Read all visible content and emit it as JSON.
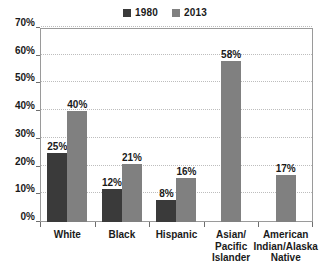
{
  "chart_data": {
    "type": "bar",
    "title": "",
    "subtitle": "",
    "xlabel": "",
    "ylabel": "",
    "ylim": [
      0,
      70
    ],
    "ytick_labels": [
      "0%",
      "10%",
      "20%",
      "30%",
      "40%",
      "50%",
      "60%",
      "70%"
    ],
    "ytick_values": [
      0,
      10,
      20,
      30,
      40,
      50,
      60,
      70
    ],
    "grid": true,
    "legend_position": "top-center",
    "categories": [
      "White",
      "Black",
      "Hispanic",
      "Asian/\nPacific\nIslander",
      "American\nIndian/Alaska\nNative"
    ],
    "series": [
      {
        "name": "1980",
        "color": "#3a3a3a",
        "values": [
          25,
          12,
          8,
          null,
          null
        ],
        "data_labels": [
          "25%",
          "12%",
          "8%",
          "",
          ""
        ]
      },
      {
        "name": "2013",
        "color": "#808080",
        "values": [
          40,
          21,
          16,
          58,
          17
        ],
        "data_labels": [
          "40%",
          "21%",
          "16%",
          "58%",
          "17%"
        ]
      }
    ]
  },
  "legend": {
    "entries": [
      {
        "label": "1980",
        "color": "#3a3a3a"
      },
      {
        "label": "2013",
        "color": "#808080"
      }
    ]
  },
  "colors": {
    "series_1980": "#3a3a3a",
    "series_2013": "#808080",
    "gridline": "#bdbdbd",
    "axis": "#6e6e6e",
    "plot_border": "#9a9a9a",
    "background": "#ffffff",
    "text": "#1a1a1a"
  }
}
